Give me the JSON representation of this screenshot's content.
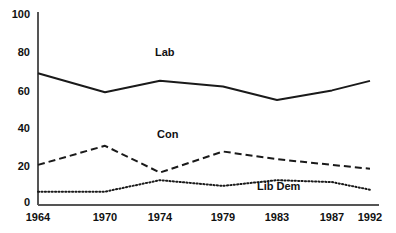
{
  "chart_data": {
    "type": "line",
    "title": "",
    "xlabel": "",
    "ylabel": "",
    "categories": [
      "1964",
      "1970",
      "1974",
      "1979",
      "1983",
      "1987",
      "1992"
    ],
    "x": [
      1964,
      1970,
      1974,
      1979,
      1983,
      1987,
      1992
    ],
    "xlim": [
      1964,
      1992
    ],
    "ylim": [
      0,
      100
    ],
    "yticks": [
      "0",
      "20",
      "40",
      "60",
      "80",
      "100"
    ],
    "ytick_values": [
      0,
      20,
      40,
      60,
      80,
      100
    ],
    "grid": false,
    "legend": "inline-series-labels",
    "series": [
      {
        "name": "Lab",
        "style": "solid",
        "color": "#1a1a1a",
        "values": [
          69,
          59,
          65,
          62,
          55,
          60,
          65
        ],
        "label_x": 1974,
        "label_y": 82
      },
      {
        "name": "Con",
        "style": "dashed",
        "color": "#1a1a1a",
        "values": [
          21,
          31,
          17,
          28,
          24,
          21,
          19
        ],
        "label_x": 1975,
        "label_y": 35
      },
      {
        "name": "Lib Dem",
        "style": "dotted",
        "color": "#1a1a1a",
        "values": [
          7,
          7,
          13,
          10,
          13,
          12,
          8
        ],
        "label_x": 1984,
        "label_y": 6
      }
    ]
  },
  "axes": {
    "y_tick_labels": [
      "100",
      "80",
      "60",
      "40",
      "20",
      "0"
    ],
    "x_tick_labels": [
      "1964",
      "1970",
      "1974",
      "1979",
      "1983",
      "1987",
      "1992"
    ],
    "axis_color": "#555555"
  },
  "series_labels": {
    "lab": "Lab",
    "con": "Con",
    "lib_dem": "Lib Dem"
  }
}
